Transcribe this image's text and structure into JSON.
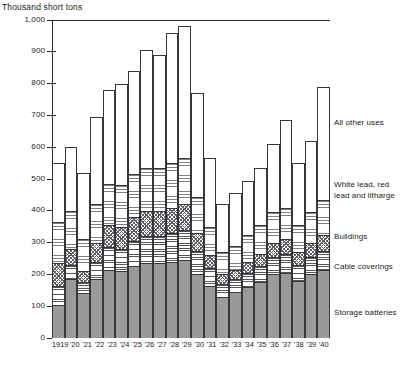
{
  "axis_caption": "Thousand short tons",
  "chart_data": {
    "type": "bar",
    "subtype": "stacked-bar",
    "title": "",
    "subtitle": "",
    "xlabel": "",
    "ylabel": "Thousand short tons",
    "ylim": [
      0,
      1000
    ],
    "yticks": [
      "0",
      "100",
      "200",
      "300",
      "400",
      "500",
      "600",
      "700",
      "800",
      "900",
      "1,000"
    ],
    "ytick_values": [
      0,
      100,
      200,
      300,
      400,
      500,
      600,
      700,
      800,
      900,
      1000
    ],
    "grid": false,
    "legend_position": "right",
    "categories": [
      "1919",
      "'20",
      "'21",
      "'22",
      "'23",
      "'24",
      "'25",
      "'26",
      "'27",
      "'28",
      "'29",
      "'30",
      "'31",
      "'32",
      "'33",
      "'34",
      "'35",
      "'36",
      "'37",
      "'38",
      "'39",
      "'40"
    ],
    "series": [
      {
        "name": "Storage batteries",
        "pattern": "solid-grey",
        "values": [
          105,
          185,
          140,
          185,
          215,
          210,
          225,
          235,
          235,
          240,
          245,
          200,
          165,
          130,
          145,
          160,
          175,
          200,
          205,
          180,
          200,
          215
        ]
      },
      {
        "name": "Cable coverings",
        "pattern": "horizontal-lines",
        "values": [
          60,
          45,
          35,
          55,
          70,
          70,
          80,
          85,
          85,
          90,
          95,
          75,
          55,
          40,
          40,
          45,
          50,
          55,
          60,
          50,
          55,
          60
        ]
      },
      {
        "name": "Buildings",
        "pattern": "checker-stipple",
        "values": [
          70,
          50,
          35,
          60,
          70,
          70,
          75,
          80,
          80,
          80,
          80,
          55,
          40,
          30,
          30,
          35,
          40,
          45,
          45,
          40,
          45,
          50
        ]
      },
      {
        "name": "White lead, red lead and litharge",
        "pattern": "fine-horizontal-hatch",
        "values": [
          130,
          120,
          100,
          120,
          130,
          130,
          135,
          135,
          135,
          140,
          145,
          115,
          90,
          70,
          75,
          85,
          90,
          95,
          100,
          85,
          95,
          110
        ]
      },
      {
        "name": "All other uses",
        "pattern": "dot-stipple",
        "values": [
          185,
          200,
          210,
          275,
          295,
          320,
          325,
          370,
          355,
          410,
          415,
          325,
          215,
          150,
          165,
          170,
          180,
          215,
          275,
          195,
          225,
          355
        ]
      }
    ],
    "totals": [
      550,
      600,
      520,
      695,
      780,
      800,
      840,
      905,
      890,
      960,
      980,
      770,
      565,
      420,
      455,
      495,
      535,
      610,
      685,
      550,
      620,
      790
    ]
  },
  "legend": [
    {
      "label": "All other uses"
    },
    {
      "label": "White lead, red\nlead and litharge"
    },
    {
      "label": "Buildings"
    },
    {
      "label": "Cable coverings"
    },
    {
      "label": "Storage batteries"
    }
  ]
}
